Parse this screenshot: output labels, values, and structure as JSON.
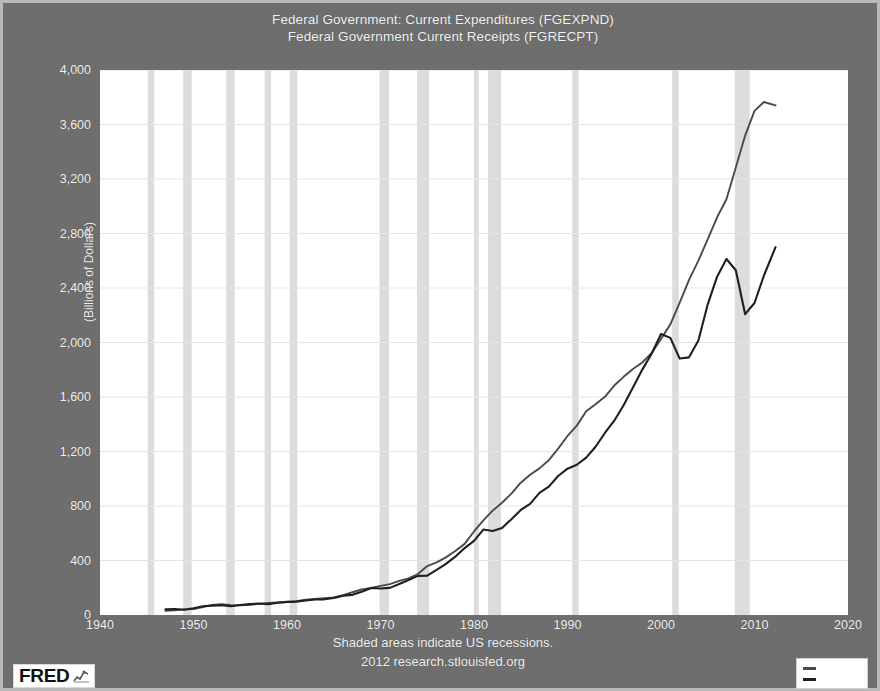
{
  "title": {
    "line1": "Federal Government: Current Expenditures (FGEXPND)",
    "line2": "Federal Government Current Receipts (FGRECPT)"
  },
  "footer": {
    "line1": "Shaded areas indicate US recessions.",
    "line2": "2012 research.stlouisfed.org"
  },
  "branding": {
    "logo_text": "FRED",
    "logo_mark": "chart-squiggle-icon"
  },
  "colors": {
    "page_background": "#6e6e6e",
    "plot_background": "#ffffff",
    "frame_border": "#b9b9b9",
    "series_expenditures": "#4a4a4a",
    "series_receipts": "#1f1f1f",
    "recession_band": "#dcdcdc",
    "gridline": "#e4e4e4",
    "tick_text": "#f2f2f2"
  },
  "legend": {
    "items": [
      {
        "name": "series-swatch-expenditures",
        "color": "#4a4a4a",
        "label": ""
      },
      {
        "name": "series-swatch-receipts",
        "color": "#1f1f1f",
        "label": ""
      }
    ]
  },
  "chart_data": {
    "type": "line",
    "title": "Federal Government: Current Expenditures (FGEXPND)\nFederal Government Current Receipts (FGRECPT)",
    "xlabel": "",
    "ylabel": "(Billions of Dollars)",
    "xlim": [
      1940,
      2020
    ],
    "ylim": [
      0,
      4000
    ],
    "xticks": [
      1940,
      1950,
      1960,
      1970,
      1980,
      1990,
      2000,
      2010,
      2020
    ],
    "xtick_labels": [
      "1940",
      "1950",
      "1960",
      "1970",
      "1980",
      "1990",
      "2000",
      "2010",
      "2020"
    ],
    "yticks": [
      0,
      400,
      800,
      1200,
      1600,
      2000,
      2400,
      2800,
      3200,
      3600,
      4000
    ],
    "ytick_labels": [
      "0",
      "400",
      "800",
      "1,200",
      "1,600",
      "2,000",
      "2,400",
      "2,800",
      "3,200",
      "3,600",
      "4,000"
    ],
    "grid": true,
    "legend_position": "bottom-right",
    "annotations": [
      "Shaded areas indicate US recessions."
    ],
    "recessions": [
      {
        "start": 1945.1,
        "end": 1945.8
      },
      {
        "start": 1948.9,
        "end": 1949.8
      },
      {
        "start": 1953.5,
        "end": 1954.4
      },
      {
        "start": 1957.6,
        "end": 1958.3
      },
      {
        "start": 1960.3,
        "end": 1961.1
      },
      {
        "start": 1969.9,
        "end": 1970.9
      },
      {
        "start": 1973.9,
        "end": 1975.2
      },
      {
        "start": 1980.0,
        "end": 1980.5
      },
      {
        "start": 1981.5,
        "end": 1982.9
      },
      {
        "start": 1990.5,
        "end": 1991.2
      },
      {
        "start": 2001.2,
        "end": 2001.9
      },
      {
        "start": 2007.9,
        "end": 2009.5
      }
    ],
    "series": [
      {
        "name": "Federal Government: Current Expenditures (FGEXPND)",
        "color": "#4a4a4a",
        "x": [
          1947,
          1948,
          1949,
          1950,
          1951,
          1952,
          1953,
          1954,
          1955,
          1956,
          1957,
          1958,
          1959,
          1960,
          1961,
          1962,
          1963,
          1964,
          1965,
          1966,
          1967,
          1968,
          1969,
          1970,
          1971,
          1972,
          1973,
          1974,
          1975,
          1976,
          1977,
          1978,
          1979,
          1980,
          1981,
          1982,
          1983,
          1984,
          1985,
          1986,
          1987,
          1988,
          1989,
          1990,
          1991,
          1992,
          1993,
          1994,
          1995,
          1996,
          1997,
          1998,
          1999,
          2000,
          2001,
          2002,
          2003,
          2004,
          2005,
          2006,
          2007,
          2008,
          2009,
          2010,
          2011,
          2012.25
        ],
        "values": [
          31,
          35,
          41,
          43,
          58,
          74,
          79,
          72,
          71,
          74,
          82,
          89,
          92,
          95,
          102,
          112,
          117,
          123,
          129,
          146,
          167,
          187,
          199,
          214,
          227,
          250,
          269,
          301,
          359,
          386,
          423,
          470,
          522,
          613,
          695,
          766,
          824,
          891,
          971,
          1029,
          1076,
          1136,
          1221,
          1314,
          1390,
          1495,
          1546,
          1601,
          1684,
          1748,
          1806,
          1853,
          1924,
          2025,
          2133,
          2293,
          2460,
          2601,
          2758,
          2919,
          3051,
          3284,
          3519,
          3700,
          3765,
          3740
        ]
      },
      {
        "name": "Federal Government Current Receipts (FGRECPT)",
        "color": "#1f1f1f",
        "x": [
          1947,
          1948,
          1949,
          1950,
          1951,
          1952,
          1953,
          1954,
          1955,
          1956,
          1957,
          1958,
          1959,
          1960,
          1961,
          1962,
          1963,
          1964,
          1965,
          1966,
          1967,
          1968,
          1969,
          1970,
          1971,
          1972,
          1973,
          1974,
          1975,
          1976,
          1977,
          1978,
          1979,
          1980,
          1981,
          1982,
          1983,
          1984,
          1985,
          1986,
          1987,
          1988,
          1989,
          1990,
          1991,
          1992,
          1993,
          1994,
          1995,
          1996,
          1997,
          1998,
          1999,
          2000,
          2001,
          2002,
          2003,
          2004,
          2005,
          2006,
          2007,
          2008,
          2009,
          2010,
          2011,
          2012.25
        ],
        "values": [
          42,
          44,
          38,
          49,
          64,
          69,
          72,
          65,
          73,
          80,
          84,
          79,
          90,
          96,
          98,
          106,
          114,
          115,
          125,
          142,
          148,
          170,
          198,
          194,
          199,
          227,
          257,
          287,
          289,
          331,
          375,
          428,
          491,
          544,
          627,
          616,
          639,
          703,
          771,
          816,
          896,
          942,
          1020,
          1074,
          1103,
          1155,
          1235,
          1336,
          1426,
          1539,
          1670,
          1801,
          1917,
          2062,
          2034,
          1882,
          1891,
          2014,
          2280,
          2483,
          2613,
          2530,
          2208,
          2290,
          2490,
          2700
        ]
      }
    ]
  }
}
